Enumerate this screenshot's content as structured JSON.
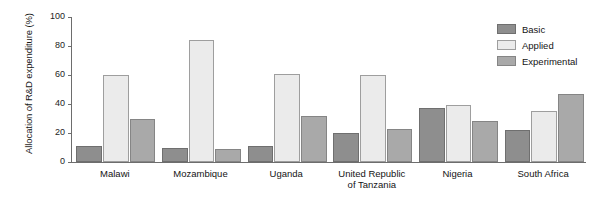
{
  "chart_data": {
    "type": "bar",
    "title": "",
    "subtitle": "",
    "xlabel": "",
    "ylabel": "Allocation of R&D expenditure (%)",
    "ylim": [
      0,
      100
    ],
    "yticks": [
      0,
      20,
      40,
      60,
      80,
      100
    ],
    "ytick_labels": [
      "0",
      "20",
      "40",
      "60",
      "80",
      "100"
    ],
    "grid": false,
    "legend_position": "top-right",
    "categories": [
      "Malawi",
      "Mozambique",
      "Uganda",
      "United Republic\nof Tanzania",
      "Nigeria",
      "South Africa"
    ],
    "series": [
      {
        "name": "Basic",
        "color": "#8e8e8e",
        "values": [
          11,
          10,
          11,
          20,
          37,
          22
        ]
      },
      {
        "name": "Applied",
        "color": "#ebebeb",
        "values": [
          60,
          84,
          61,
          60,
          39,
          35
        ]
      },
      {
        "name": "Experimental",
        "color": "#a9a9a9",
        "values": [
          30,
          9,
          32,
          23,
          28,
          47
        ]
      }
    ]
  },
  "axis": {
    "y_title": "Allocation of R&D expenditure (%)",
    "ticks": [
      {
        "label": "100",
        "value": 100
      },
      {
        "label": "80",
        "value": 80
      },
      {
        "label": "60",
        "value": 60
      },
      {
        "label": "40",
        "value": 40
      },
      {
        "label": "20",
        "value": 20
      },
      {
        "label": "0",
        "value": 0
      }
    ]
  },
  "legend": {
    "items": [
      {
        "label": "Basic",
        "color": "#8e8e8e"
      },
      {
        "label": "Applied",
        "color": "#ebebeb"
      },
      {
        "label": "Experimental",
        "color": "#a9a9a9"
      }
    ]
  }
}
